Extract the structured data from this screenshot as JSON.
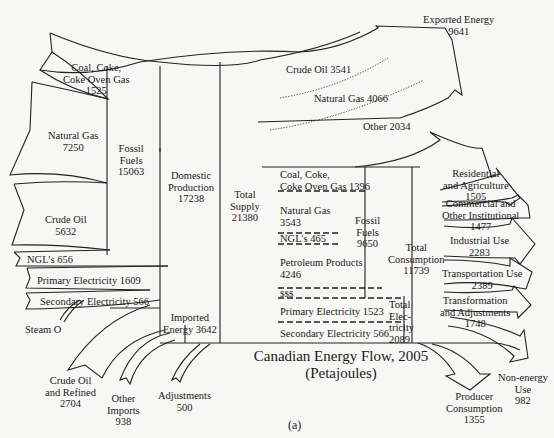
{
  "figure": {
    "title_line1": "Canadian Energy Flow, 2005",
    "title_line2": "(Petajoules)",
    "caption": "(a)"
  },
  "sources": {
    "coal": {
      "line1": "Coal, Coke,",
      "line2": "Coke Oven Gas",
      "value": "1525"
    },
    "natural_gas": {
      "line1": "Natural Gas",
      "value": "7250"
    },
    "crude_oil": {
      "line1": "Crude Oil",
      "value": "5632"
    },
    "ngl": {
      "label": "NGL's 656"
    },
    "primary_electricity": {
      "label": "Primary Electricity 1609"
    },
    "secondary_electricity": {
      "label": "Secondary Electricity 566"
    },
    "steam": {
      "label": "Steam O"
    }
  },
  "aggregates": {
    "fossil_fuels": {
      "line1": "Fossil",
      "line2": "Fuels",
      "value": "15063"
    },
    "domestic_production": {
      "line1": "Domestic",
      "line2": "Production",
      "value": "17238"
    },
    "total_supply": {
      "line1": "Total",
      "line2": "Supply",
      "value": "21380"
    },
    "imported_energy": {
      "line1": "Imported",
      "line2": "Energy 3642"
    }
  },
  "imports": {
    "crude_refined": {
      "line1": "Crude Oil",
      "line2": "and Refined",
      "line3": "Products",
      "value": "2704"
    },
    "other_imports": {
      "line1": "Other",
      "line2": "Imports",
      "value": "938"
    },
    "adjustments": {
      "line1": "Adjustments",
      "value": "500"
    }
  },
  "exports": {
    "exported_energy": {
      "line1": "Exported Energy",
      "value": "9641"
    },
    "crude_oil": {
      "label": "Crude Oil 3541"
    },
    "natural_gas": {
      "label": "Natural Gas 4066"
    },
    "other": {
      "label": "Other 2034"
    }
  },
  "consumption_mix": {
    "coal": {
      "line1": "Coal, Coke,",
      "line2": "Coke Oven Gas 1396"
    },
    "natural_gas": {
      "line1": "Natural Gas",
      "value": "3543"
    },
    "ngl": {
      "label": "NGL's 465"
    },
    "petroleum": {
      "line1": "Petroleum Products",
      "value": "4246"
    },
    "sss": {
      "label": "$$$"
    },
    "primary_electricity": {
      "label": "Primary Electricity 1523"
    },
    "secondary_electricity": {
      "label": "Secondary Electricity 566"
    },
    "fossil_fuels": {
      "line1": "Fossil",
      "line2": "Fuels",
      "value": "9650"
    },
    "total_electricity": {
      "line1": "Total",
      "line2": "Elec-",
      "line3": "tricity",
      "value": "2089"
    },
    "total_consumption": {
      "line1": "Total",
      "line2": "Consumption",
      "value": "11739"
    }
  },
  "end_uses": {
    "residential": {
      "line1": "Residential",
      "line2": "and Agriculture",
      "value": "1505"
    },
    "commercial": {
      "line1": "Commercial and",
      "line2": "Other Institutional",
      "value": "1477"
    },
    "industrial": {
      "line1": "Industrial Use",
      "value": "2283"
    },
    "transportation": {
      "line1": "Transportation Use",
      "value": "2389"
    },
    "transformation": {
      "line1": "Transformation",
      "line2": "and Adjustments",
      "value": "1748"
    },
    "non_energy": {
      "line1": "Non-energy",
      "line2": "Use",
      "value": "982"
    },
    "producer": {
      "line1": "Producer",
      "line2": "Consumption",
      "value": "1355"
    }
  }
}
